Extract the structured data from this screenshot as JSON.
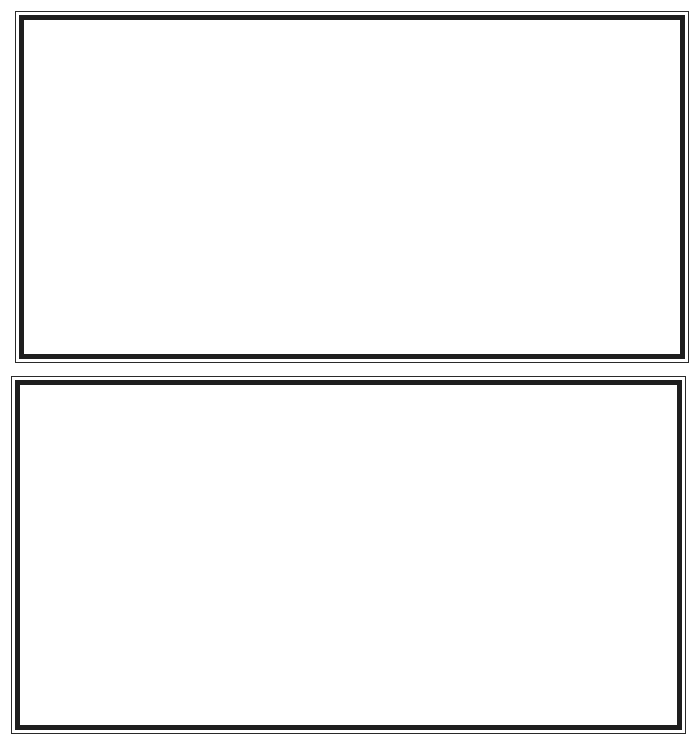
{
  "page": {
    "background_color": "#ffffff",
    "line_color": "#1e1e1e"
  },
  "frames": [
    {
      "label": "",
      "content": ""
    },
    {
      "label": "",
      "content": ""
    }
  ]
}
